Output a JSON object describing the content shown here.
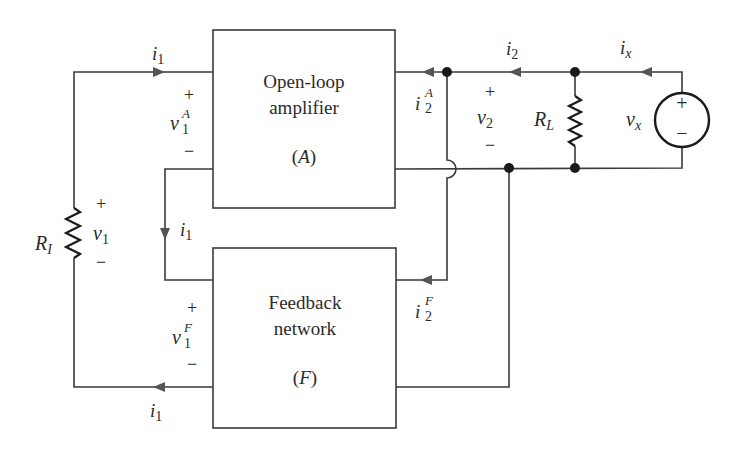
{
  "diagram": {
    "type": "feedback-amplifier-circuit",
    "blocks": {
      "amplifier": {
        "line1": "Open-loop",
        "line2": "amplifier",
        "symbol": "(A)",
        "symbol_letter": "A"
      },
      "feedback": {
        "line1": "Feedback",
        "line2": "network",
        "symbol": "(F)",
        "symbol_letter": "F"
      }
    },
    "components": {
      "input_resistor": {
        "label_main": "R",
        "label_sub": "I"
      },
      "load_resistor": {
        "label_main": "R",
        "label_sub": "L"
      },
      "test_source": {
        "label_main": "v",
        "label_sub": "x",
        "plus": "+",
        "minus": "−"
      }
    },
    "currents": {
      "i1_top": {
        "main": "i",
        "sub": "1"
      },
      "i1_inner": {
        "main": "i",
        "sub": "1"
      },
      "i1_bottom": {
        "main": "i",
        "sub": "1"
      },
      "i2": {
        "main": "i",
        "sub": "2"
      },
      "ix": {
        "main": "i",
        "sub": "x"
      },
      "i2A": {
        "main": "i",
        "sub": "2",
        "sup": "A"
      },
      "i2F": {
        "main": "i",
        "sub": "2",
        "sup": "F"
      }
    },
    "voltages": {
      "v1": {
        "main": "v",
        "sub": "1",
        "plus": "+",
        "minus": "−"
      },
      "v1A": {
        "main": "v",
        "sub": "1",
        "sup": "A",
        "plus": "+",
        "minus": "−"
      },
      "v1F": {
        "main": "v",
        "sub": "1",
        "sup": "F",
        "plus": "+",
        "minus": "−"
      },
      "v2": {
        "main": "v",
        "sub": "2",
        "plus": "+",
        "minus": "−"
      }
    },
    "colors": {
      "wire": "#3a3a3a",
      "node": "#1a1a1a",
      "arrow": "#555555",
      "background": "#ffffff"
    }
  }
}
